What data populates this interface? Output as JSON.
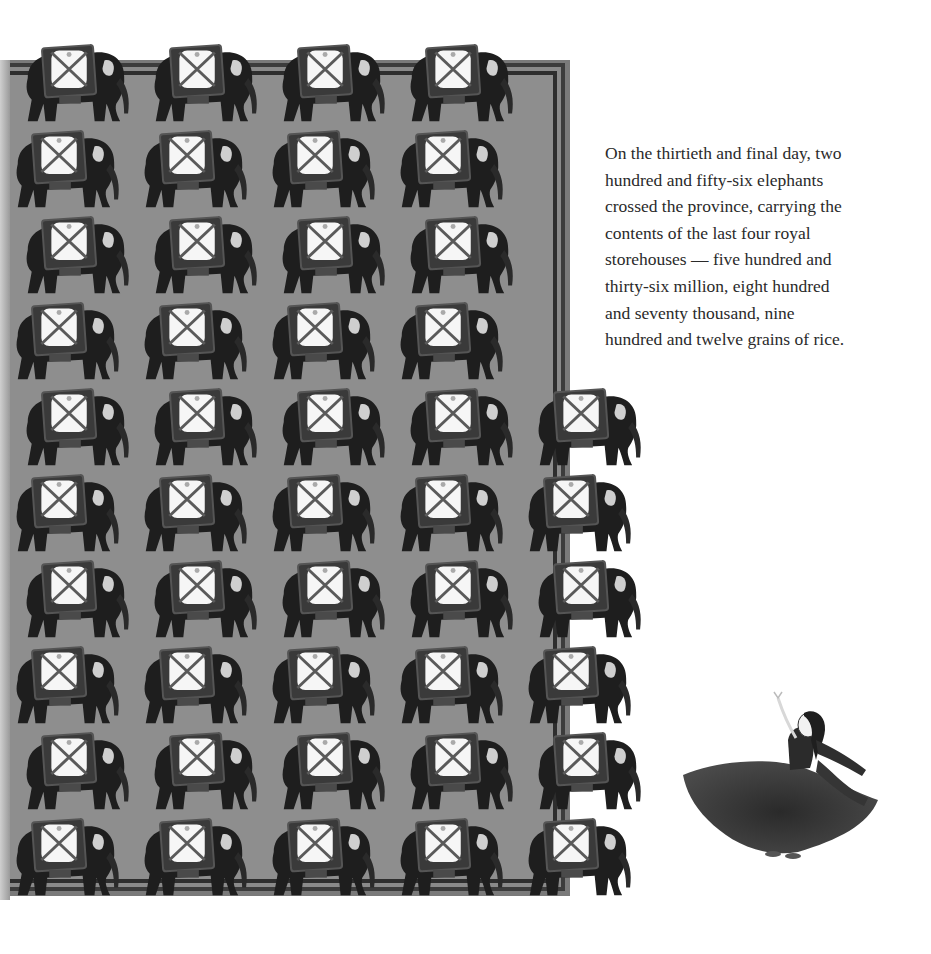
{
  "page": {
    "story_lines": [
      "On the thirtieth and final day, two",
      "hundred and fifty-six elephants",
      "crossed the province, carrying the",
      "contents of the last four royal",
      "storehouses — five hundred and",
      "thirty-six million, eight hundred",
      "and seventy thousand, nine",
      "hundred and twelve grains of rice."
    ]
  },
  "illustration": {
    "panel_color": "#8e8e8e",
    "frame_color": "#2e2e2e",
    "elephant_rows": 10,
    "elephant_columns_top_rows": 4,
    "elephant_columns_lower_rows": 5,
    "subject": "elephants carrying rice storehouse loads",
    "figure": "dancing girl in dark flowing skirt"
  }
}
